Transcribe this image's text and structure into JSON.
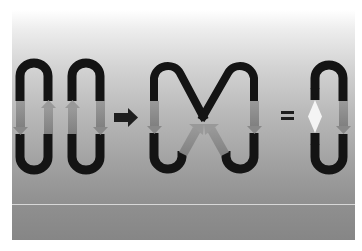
{
  "figure": {
    "operators": {
      "transform_arrow": "→",
      "equals": "="
    },
    "parts": [
      {
        "id": "loop-1",
        "left_arrow": "down",
        "right_arrow": "up"
      },
      {
        "id": "loop-2",
        "left_arrow": "up",
        "right_arrow": "down"
      },
      {
        "id": "crossed-loop",
        "left_arrow": "down",
        "right_arrow": "down",
        "center_arrows": "up-converging"
      },
      {
        "id": "pinched-loop",
        "left": "pinched with white diamond",
        "right_arrow": "down"
      }
    ],
    "colors": {
      "strand": "#141414",
      "arrow": "#8c8c8c",
      "diamond": "#f4f4f4",
      "operator": "#1e1e1e"
    }
  }
}
